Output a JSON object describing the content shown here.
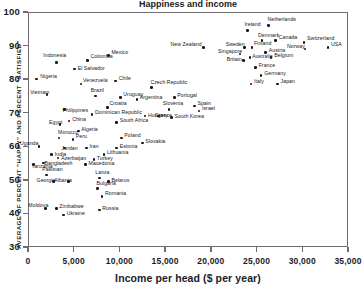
{
  "chart_data": {
    "type": "scatter",
    "title": "Happiness and income",
    "xlabel": "Income per head ($ per year)",
    "ylabel": "AVERAGE OF PERCENT \"HAPPY\" AND PERCENT \"SATISFIED\"",
    "xlim": [
      0,
      35000
    ],
    "ylim": [
      30,
      100
    ],
    "xticks": [
      0,
      5000,
      10000,
      15000,
      20000,
      25000,
      30000,
      35000
    ],
    "xticklabels": [
      "0",
      "5,000",
      "10,000",
      "15,000",
      "20,000",
      "25,000",
      "30,000",
      "35,000"
    ],
    "yticks": [
      30,
      40,
      50,
      60,
      70,
      80,
      90,
      100
    ],
    "yticklabels": [
      "30",
      "40",
      "50",
      "60",
      "70",
      "80",
      "90",
      "100"
    ],
    "grid": false,
    "legend": false,
    "marker_color": "#16161a",
    "frame_color": "#6e6e72",
    "points": [
      {
        "label": "Indonesia",
        "x": 3100,
        "y": 85.0,
        "lx": -13,
        "ly": -7
      },
      {
        "label": "Nigeria",
        "x": 900,
        "y": 80.0,
        "lx": 4,
        "ly": -3
      },
      {
        "label": "Vietnam",
        "x": 2100,
        "y": 75.5,
        "lx": -17,
        "ly": -2
      },
      {
        "label": "Colombia",
        "x": 6500,
        "y": 85.5,
        "lx": 3,
        "ly": -5
      },
      {
        "label": "Mexico",
        "x": 8800,
        "y": 87.0,
        "lx": 3,
        "ly": -4
      },
      {
        "label": "El Salvador",
        "x": 5100,
        "y": 83.0,
        "lx": 3,
        "ly": -1
      },
      {
        "label": "Venezuela",
        "x": 5800,
        "y": 78.5,
        "lx": 2,
        "ly": -4
      },
      {
        "label": "Chile",
        "x": 9600,
        "y": 79.5,
        "lx": 3,
        "ly": -3
      },
      {
        "label": "Brazil",
        "x": 7400,
        "y": 75.0,
        "lx": -5,
        "ly": -6
      },
      {
        "label": "Uruguay",
        "x": 10100,
        "y": 74.5,
        "lx": 3,
        "ly": -4
      },
      {
        "label": "Philippines",
        "x": 4000,
        "y": 71.0,
        "lx": -2,
        "ly": 1
      },
      {
        "label": "Croatia",
        "x": 8700,
        "y": 71.5,
        "lx": 2,
        "ly": -5
      },
      {
        "label": "Dominican Republic",
        "x": 7000,
        "y": 69.5,
        "lx": 3,
        "ly": -2
      },
      {
        "label": "Hungary",
        "x": 12800,
        "y": 69.0,
        "lx": 3,
        "ly": -1
      },
      {
        "label": "Egypt",
        "x": 3500,
        "y": 66.5,
        "lx": -11,
        "ly": -2
      },
      {
        "label": "China",
        "x": 4500,
        "y": 67.5,
        "lx": 3,
        "ly": -2
      },
      {
        "label": "South Africa",
        "x": 9700,
        "y": 67.0,
        "lx": 3,
        "ly": -3
      },
      {
        "label": "Algeria",
        "x": 5500,
        "y": 64.5,
        "lx": 3,
        "ly": -2
      },
      {
        "label": "Morocco",
        "x": 3400,
        "y": 62.5,
        "lx": -1,
        "ly": -6
      },
      {
        "label": "Peru",
        "x": 4900,
        "y": 62.0,
        "lx": 3,
        "ly": -4
      },
      {
        "label": "Poland",
        "x": 10200,
        "y": 62.5,
        "lx": 3,
        "ly": -3
      },
      {
        "label": "Slovakia",
        "x": 12500,
        "y": 61.0,
        "lx": 3,
        "ly": -2
      },
      {
        "label": "Uganda",
        "x": 1200,
        "y": 60.0,
        "lx": -19,
        "ly": -3
      },
      {
        "label": "Jordan",
        "x": 4000,
        "y": 59.5,
        "lx": -3,
        "ly": 0
      },
      {
        "label": "Iran",
        "x": 6400,
        "y": 59.5,
        "lx": 3,
        "ly": -2
      },
      {
        "label": "Estonia",
        "x": 9700,
        "y": 59.5,
        "lx": 3,
        "ly": -2
      },
      {
        "label": "India",
        "x": 2600,
        "y": 57.5,
        "lx": 3,
        "ly": -1
      },
      {
        "label": "Azerbaijan",
        "x": 3300,
        "y": 56.5,
        "lx": 3,
        "ly": 0
      },
      {
        "label": "Lithuania",
        "x": 8300,
        "y": 57.5,
        "lx": 3,
        "ly": -3
      },
      {
        "label": "Turkey",
        "x": 7200,
        "y": 56.0,
        "lx": 3,
        "ly": -2
      },
      {
        "label": "Bangladesh",
        "x": 1700,
        "y": 55.0,
        "lx": 1,
        "ly": 0
      },
      {
        "label": "Tanzania",
        "x": 600,
        "y": 54.5,
        "lx": -2,
        "ly": 1
      },
      {
        "label": "Macedonia",
        "x": 6300,
        "y": 54.5,
        "lx": 3,
        "ly": -2
      },
      {
        "label": "Pakistan",
        "x": 2000,
        "y": 51.5,
        "lx": -4,
        "ly": -6
      },
      {
        "label": "Georgia",
        "x": 2800,
        "y": 49.5,
        "lx": -17,
        "ly": -2
      },
      {
        "label": "Albania",
        "x": 4400,
        "y": 49.5,
        "lx": -14,
        "ly": -2
      },
      {
        "label": "Latvia",
        "x": 7800,
        "y": 50.5,
        "lx": -4,
        "ly": -6
      },
      {
        "label": "Belarus",
        "x": 8800,
        "y": 49.5,
        "lx": 3,
        "ly": -2
      },
      {
        "label": "Bulgaria",
        "x": 7600,
        "y": 47.5,
        "lx": -1,
        "ly": -5
      },
      {
        "label": "Romania",
        "x": 8100,
        "y": 45.0,
        "lx": 3,
        "ly": -4
      },
      {
        "label": "Moldova",
        "x": 1900,
        "y": 41.5,
        "lx": -17,
        "ly": -3
      },
      {
        "label": "Zimbabwe",
        "x": 3100,
        "y": 41.5,
        "lx": 3,
        "ly": -2
      },
      {
        "label": "Ukraine",
        "x": 3900,
        "y": 39.5,
        "lx": 3,
        "ly": -2
      },
      {
        "label": "Russia",
        "x": 7800,
        "y": 41.0,
        "lx": 3,
        "ly": -2
      },
      {
        "label": "Czech Republic",
        "x": 13500,
        "y": 77.5,
        "lx": -1,
        "ly": -6
      },
      {
        "label": "Argentina",
        "x": 11900,
        "y": 74.0,
        "lx": 3,
        "ly": -2
      },
      {
        "label": "Portugal",
        "x": 16000,
        "y": 74.5,
        "lx": 3,
        "ly": -3
      },
      {
        "label": "Slovenia",
        "x": 15400,
        "y": 71.0,
        "lx": -6,
        "ly": -6
      },
      {
        "label": "Greece",
        "x": 14300,
        "y": 69.0,
        "lx": -4,
        "ly": -1
      },
      {
        "label": "Spain",
        "x": 18200,
        "y": 72.0,
        "lx": 3,
        "ly": -3
      },
      {
        "label": "Israel",
        "x": 18700,
        "y": 70.5,
        "lx": 3,
        "ly": -3
      },
      {
        "label": "South Korea",
        "x": 15700,
        "y": 68.5,
        "lx": 3,
        "ly": -2
      },
      {
        "label": "New Zealand",
        "x": 19200,
        "y": 89.5,
        "lx": -33,
        "ly": -3
      },
      {
        "label": "Ireland",
        "x": 24000,
        "y": 94.5,
        "lx": -3,
        "ly": -6
      },
      {
        "label": "Netherlands",
        "x": 26300,
        "y": 96.0,
        "lx": -1,
        "ly": -6
      },
      {
        "label": "Denmark",
        "x": 25600,
        "y": 91.5,
        "lx": -4,
        "ly": -6
      },
      {
        "label": "Canada",
        "x": 27100,
        "y": 91.5,
        "lx": 3,
        "ly": -4
      },
      {
        "label": "Switzerland",
        "x": 30200,
        "y": 91.0,
        "lx": 3,
        "ly": -4
      },
      {
        "label": "Sweden",
        "x": 23700,
        "y": 89.5,
        "lx": -19,
        "ly": -3
      },
      {
        "label": "Finland",
        "x": 24500,
        "y": 89.5,
        "lx": 2,
        "ly": -4
      },
      {
        "label": "Norway",
        "x": 30300,
        "y": 89.0,
        "lx": -18,
        "ly": -3
      },
      {
        "label": "USA",
        "x": 32800,
        "y": 89.5,
        "lx": 3,
        "ly": -3
      },
      {
        "label": "Singapore",
        "x": 23200,
        "y": 87.5,
        "lx": -22,
        "ly": -3
      },
      {
        "label": "Austria",
        "x": 26000,
        "y": 88.0,
        "lx": 3,
        "ly": -2
      },
      {
        "label": "Belgium",
        "x": 26600,
        "y": 86.5,
        "lx": 3,
        "ly": -2
      },
      {
        "label": "Australia",
        "x": 24300,
        "y": 86.5,
        "lx": 2,
        "ly": -1
      },
      {
        "label": "Britain",
        "x": 23600,
        "y": 85.5,
        "lx": -17,
        "ly": -2
      },
      {
        "label": "France",
        "x": 24900,
        "y": 83.5,
        "lx": 3,
        "ly": -2
      },
      {
        "label": "Germany",
        "x": 25500,
        "y": 81.0,
        "lx": 3,
        "ly": -3
      },
      {
        "label": "Italy",
        "x": 24400,
        "y": 78.5,
        "lx": 3,
        "ly": -3
      },
      {
        "label": "Japan",
        "x": 27300,
        "y": 78.5,
        "lx": 3,
        "ly": -3
      }
    ]
  }
}
